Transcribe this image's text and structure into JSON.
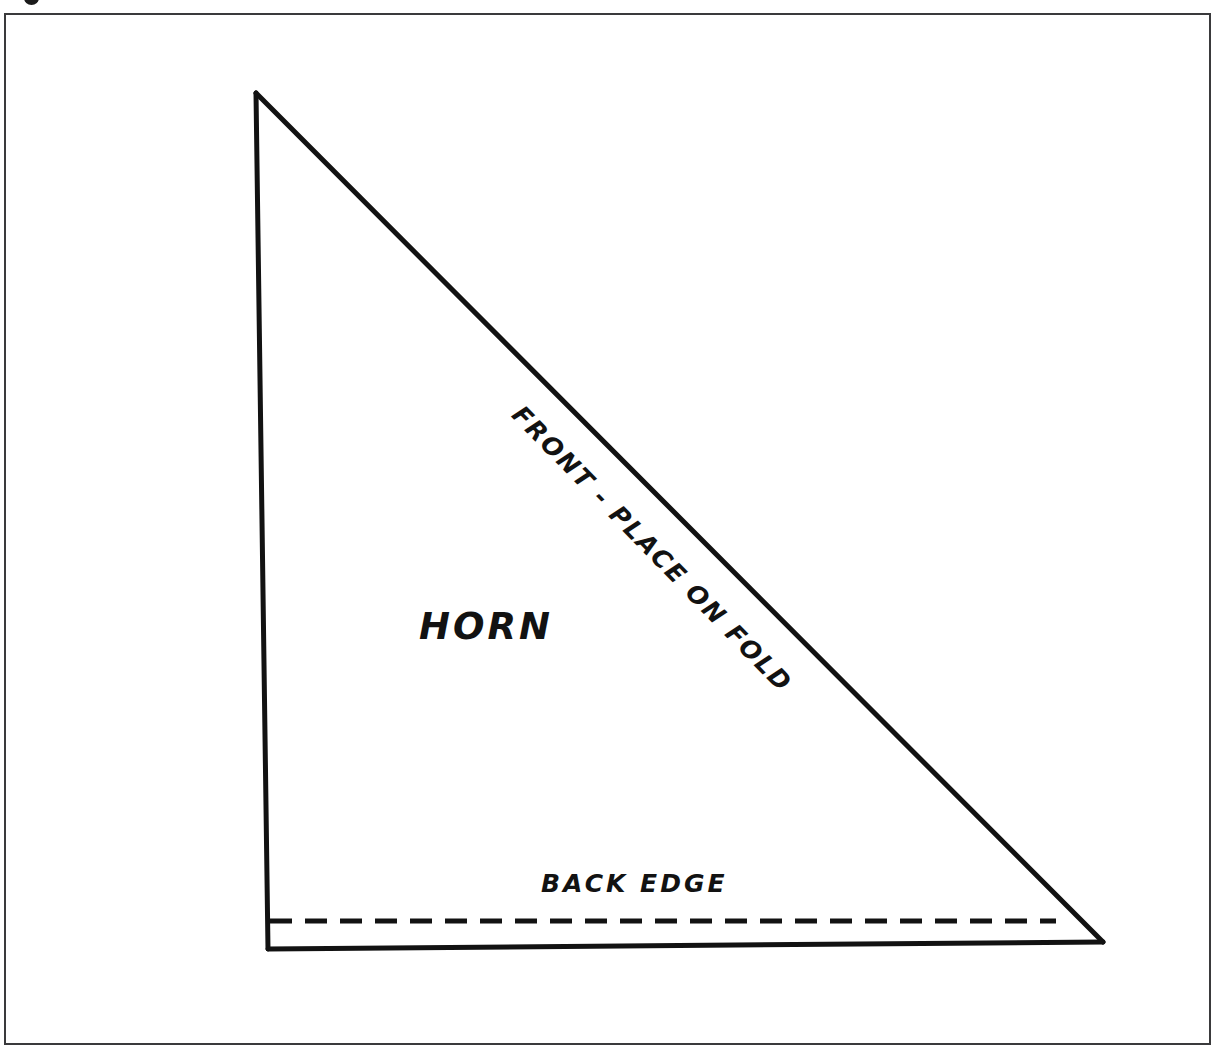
{
  "document": {
    "title": "Horn Pattern Piece Diagram",
    "type": "sewing-pattern-line-drawing",
    "background_color": "#ffffff",
    "ink_color": "#121212",
    "frame_color": "#3a3a3c"
  },
  "frame": {
    "present": true,
    "left": 4,
    "top": 13,
    "width": 1207,
    "height": 1032,
    "stroke_width": 2
  },
  "artifact": {
    "name": "cropped-glyph-top-edge",
    "description": "partial dark mark cut off by top image edge"
  },
  "labels": {
    "piece_name": "HORN",
    "fold_edge": "FRONT - PLACE ON FOLD",
    "back_edge": "BACK EDGE"
  },
  "shape": {
    "type": "right-triangle",
    "vertices": [
      {
        "name": "apex-top",
        "x": 256,
        "y": 93
      },
      {
        "name": "corner-bottom-left",
        "x": 268,
        "y": 949
      },
      {
        "name": "corner-bottom-right",
        "x": 1103,
        "y": 942
      }
    ],
    "stroke_width": 5,
    "edges": [
      {
        "name": "left-edge",
        "style": "solid"
      },
      {
        "name": "hypotenuse-fold-edge",
        "style": "solid"
      },
      {
        "name": "bottom-edge",
        "style": "solid"
      }
    ]
  },
  "dashed_line": {
    "name": "back-edge-stitch-line",
    "style": "dashed",
    "x_start": 270,
    "x_end": 1056,
    "y": 921,
    "stroke_width": 5,
    "dash": 22,
    "gap": 13
  }
}
